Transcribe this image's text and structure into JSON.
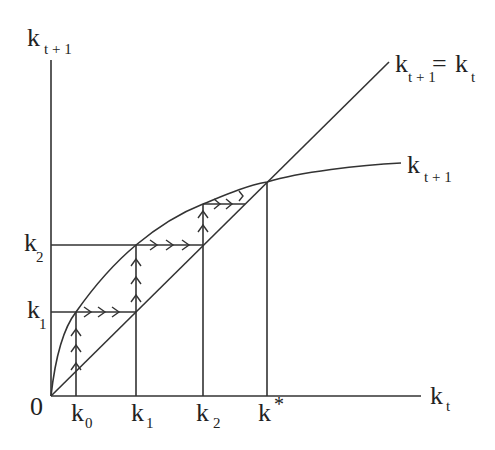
{
  "diagram": {
    "y_axis_label": {
      "main": "k",
      "sub": "t + 1"
    },
    "x_axis_label": {
      "main": "k",
      "sub": "t"
    },
    "origin_label": "0",
    "line_45_label": {
      "main1": "k",
      "sub1": "t + 1",
      "eq": "=",
      "main2": "k",
      "sub2": "t"
    },
    "curve_label": {
      "main": "k",
      "sub": "t + 1"
    },
    "x_ticks": [
      {
        "main": "k",
        "sub": "0"
      },
      {
        "main": "k",
        "sub": "1"
      },
      {
        "main": "k",
        "sub": "2"
      },
      {
        "main": "k",
        "sub": "*"
      }
    ],
    "y_ticks": [
      {
        "main": "k",
        "sub": "2"
      },
      {
        "main": "k",
        "sub": "1"
      }
    ],
    "colors": {
      "line": "#333333",
      "text": "#222222",
      "background": "#ffffff"
    }
  }
}
